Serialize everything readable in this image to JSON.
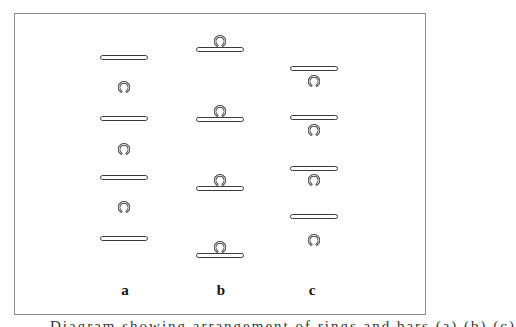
{
  "figure": {
    "frame": {
      "left": 14,
      "top": 13,
      "right": 426,
      "bottom": 315,
      "border_color": "#8c8c8c"
    },
    "columns": [
      {
        "label": "a",
        "label_x": 125,
        "arrangement": "rings between bars",
        "bars": [
          {
            "x": 100,
            "y": 55
          },
          {
            "x": 100,
            "y": 116
          },
          {
            "x": 100,
            "y": 175
          },
          {
            "x": 100,
            "y": 236
          }
        ],
        "rings": [
          {
            "x": 118,
            "y": 79
          },
          {
            "x": 118,
            "y": 141
          },
          {
            "x": 118,
            "y": 199
          }
        ]
      },
      {
        "label": "b",
        "label_x": 221,
        "arrangement": "rings resting on top of bars",
        "bars": [
          {
            "x": 196,
            "y": 47
          },
          {
            "x": 196,
            "y": 117
          },
          {
            "x": 196,
            "y": 186
          },
          {
            "x": 196,
            "y": 253
          }
        ],
        "rings": [
          {
            "x": 214,
            "y": 33
          },
          {
            "x": 214,
            "y": 103
          },
          {
            "x": 214,
            "y": 172
          },
          {
            "x": 214,
            "y": 239
          }
        ]
      },
      {
        "label": "c",
        "label_x": 312,
        "arrangement": "rings hanging just below bars",
        "bars": [
          {
            "x": 290,
            "y": 66
          },
          {
            "x": 290,
            "y": 115
          },
          {
            "x": 290,
            "y": 166
          },
          {
            "x": 290,
            "y": 214
          }
        ],
        "rings": [
          {
            "x": 308,
            "y": 73
          },
          {
            "x": 308,
            "y": 122
          },
          {
            "x": 308,
            "y": 172
          },
          {
            "x": 308,
            "y": 232
          }
        ]
      }
    ],
    "label_y": 283,
    "icons": {
      "ring": "open-ring-icon",
      "bar": "horizontal-bar"
    },
    "colors": {
      "stroke": "#3a3a3a",
      "background": "#ffffff"
    }
  },
  "caption": {
    "text": "Diagram showing arrangement of rings and bars (a) (b) (c)",
    "note": "caption clipped at bottom edge"
  }
}
